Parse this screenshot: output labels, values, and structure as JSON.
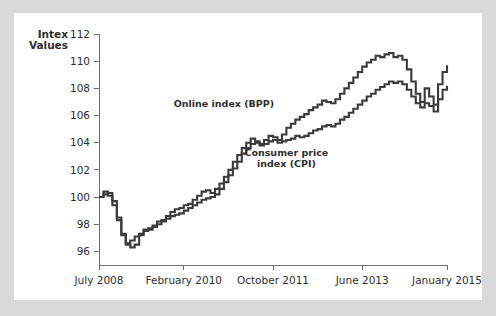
{
  "chart_data": {
    "type": "line",
    "title": "",
    "xlabel": "",
    "ylabel": "Intex Values",
    "ylabel_lines": [
      "Intex",
      "Values"
    ],
    "ylim": [
      95,
      112
    ],
    "yticks": [
      112,
      110,
      108,
      106,
      104,
      102,
      100,
      98,
      96
    ],
    "ytick_labels": [
      "112",
      "110",
      "108",
      "106",
      "104",
      "102",
      "100",
      "98",
      "96"
    ],
    "xticks": [
      0,
      19,
      39,
      59,
      78
    ],
    "xtick_labels": [
      "July 2008",
      "February 2010",
      "October 2011",
      "June 2013",
      "January 2015"
    ],
    "grid": false,
    "legend_position": "inline-annotation",
    "line_color": "#3b3b3b",
    "annotations": [
      {
        "text": "Online index (BPP)",
        "x_index": 28,
        "y_value": 106.6
      },
      {
        "text": "Consumer price",
        "x_index": 42,
        "y_value": 103.0
      },
      {
        "text": "index (CPI)",
        "x_index": 42,
        "y_value": 102.2
      }
    ],
    "series": [
      {
        "name": "Online index (BPP)",
        "values": [
          100.0,
          100.4,
          100.3,
          99.7,
          98.5,
          97.3,
          96.6,
          96.3,
          96.5,
          97.2,
          97.6,
          97.7,
          97.9,
          98.2,
          98.3,
          98.6,
          98.9,
          99.1,
          99.2,
          99.4,
          99.5,
          99.8,
          100.1,
          100.4,
          100.5,
          100.3,
          100.6,
          101.0,
          101.5,
          102.0,
          102.6,
          103.1,
          103.6,
          104.0,
          104.3,
          104.1,
          103.9,
          104.2,
          104.5,
          104.4,
          104.2,
          104.6,
          105.1,
          105.4,
          105.7,
          105.9,
          106.1,
          106.4,
          106.6,
          106.8,
          107.1,
          107.0,
          106.9,
          107.2,
          107.6,
          108.0,
          108.4,
          108.8,
          109.2,
          109.6,
          109.9,
          110.1,
          110.4,
          110.3,
          110.5,
          110.6,
          110.3,
          110.4,
          110.1,
          109.4,
          108.5,
          107.6,
          107.0,
          108.0,
          107.4,
          106.8,
          108.3,
          109.2,
          109.7
        ]
      },
      {
        "name": "Consumer price index (CPI)",
        "values": [
          100.0,
          100.2,
          100.1,
          99.4,
          98.3,
          97.2,
          96.5,
          96.8,
          97.1,
          97.3,
          97.5,
          97.6,
          97.8,
          98.0,
          98.2,
          98.4,
          98.6,
          98.7,
          98.8,
          99.0,
          99.2,
          99.4,
          99.6,
          99.8,
          99.9,
          100.0,
          100.2,
          100.6,
          101.1,
          101.6,
          102.1,
          102.6,
          103.2,
          103.6,
          103.9,
          104.0,
          103.8,
          103.9,
          104.1,
          104.2,
          104.0,
          104.1,
          104.2,
          104.3,
          104.5,
          104.4,
          104.5,
          104.7,
          104.9,
          105.0,
          105.2,
          105.3,
          105.2,
          105.4,
          105.7,
          105.9,
          106.2,
          106.5,
          106.8,
          107.1,
          107.4,
          107.6,
          107.9,
          108.1,
          108.3,
          108.5,
          108.4,
          108.5,
          108.3,
          107.9,
          107.4,
          106.9,
          106.6,
          106.9,
          106.7,
          106.3,
          107.2,
          107.9,
          108.2
        ]
      }
    ]
  }
}
